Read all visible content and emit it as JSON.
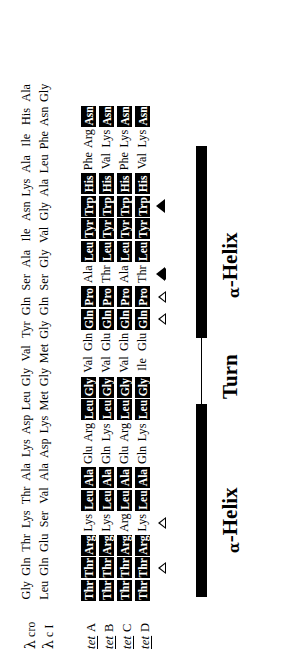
{
  "figure": {
    "sequence_rows": [
      {
        "id": "lambda-cro",
        "label_lambda": "λ",
        "label_name": "cro",
        "style": "plain",
        "residues": [
          "Gly",
          "Gln",
          "Thr",
          "Lys",
          "Thr",
          "Ala",
          "Lys",
          "Asp",
          "Leu",
          "Gly",
          "Val",
          "Tyr",
          "Gln",
          "Ser",
          "Ala",
          "Ile",
          "Asn",
          "Lys",
          "Ala",
          "Ile",
          "His",
          "Ala"
        ]
      },
      {
        "id": "lambda-ci",
        "label_lambda": "λ",
        "label_name": "c I",
        "style": "plain",
        "residues": [
          "Leu",
          "Gln",
          "Glu",
          "Ser",
          "Val",
          "Ala",
          "Asp",
          "Lys",
          "Met",
          "Gly",
          "Met",
          "Gly",
          "Gln",
          "Ser",
          "Gly",
          "Val",
          "Gly",
          "Ala",
          "Leu",
          "Phe",
          "Asn",
          "Gly"
        ]
      },
      {
        "id": "tet-A",
        "label_italic": "tet",
        "label_chain": "A",
        "style": "tet",
        "residues": [
          {
            "t": "Thr",
            "b": true
          },
          {
            "t": "Thr",
            "b": true
          },
          {
            "t": "Arg",
            "b": true
          },
          {
            "t": "Lys",
            "b": false
          },
          {
            "t": "Leu",
            "b": true
          },
          {
            "t": "Ala",
            "b": true
          },
          {
            "t": "Glu",
            "b": false
          },
          {
            "t": "Arg",
            "b": false
          },
          {
            "t": "Leu",
            "b": true
          },
          {
            "t": "Gly",
            "b": true
          },
          {
            "t": "Val",
            "b": false
          },
          {
            "t": "Gln",
            "b": false
          },
          {
            "t": "Gln",
            "b": true
          },
          {
            "t": "Pro",
            "b": true
          },
          {
            "t": "Ala",
            "b": false
          },
          {
            "t": "Leu",
            "b": true
          },
          {
            "t": "Tyr",
            "b": true
          },
          {
            "t": "Trp",
            "b": true
          },
          {
            "t": "His",
            "b": true
          },
          {
            "t": "Phe",
            "b": false
          },
          {
            "t": "Arg",
            "b": false
          },
          {
            "t": "Asn",
            "b": true
          }
        ]
      },
      {
        "id": "tet-B",
        "label_italic": "tet",
        "label_chain": "B",
        "style": "tet",
        "residues": [
          {
            "t": "Thr",
            "b": true
          },
          {
            "t": "Thr",
            "b": true
          },
          {
            "t": "Arg",
            "b": true
          },
          {
            "t": "Lys",
            "b": false
          },
          {
            "t": "Leu",
            "b": true
          },
          {
            "t": "Ala",
            "b": true
          },
          {
            "t": "Gln",
            "b": false
          },
          {
            "t": "Lys",
            "b": false
          },
          {
            "t": "Leu",
            "b": true
          },
          {
            "t": "Gly",
            "b": true
          },
          {
            "t": "Val",
            "b": false
          },
          {
            "t": "Glu",
            "b": false
          },
          {
            "t": "Gln",
            "b": true
          },
          {
            "t": "Pro",
            "b": true
          },
          {
            "t": "Thr",
            "b": false
          },
          {
            "t": "Leu",
            "b": true
          },
          {
            "t": "Tyr",
            "b": true
          },
          {
            "t": "Trp",
            "b": true
          },
          {
            "t": "His",
            "b": true
          },
          {
            "t": "Val",
            "b": false
          },
          {
            "t": "Lys",
            "b": false
          },
          {
            "t": "Asn",
            "b": true
          }
        ]
      },
      {
        "id": "tet-C",
        "label_italic": "tet",
        "label_chain": "C",
        "style": "tet",
        "residues": [
          {
            "t": "Thr",
            "b": true
          },
          {
            "t": "Thr",
            "b": true
          },
          {
            "t": "Arg",
            "b": true
          },
          {
            "t": "Arg",
            "b": false
          },
          {
            "t": "Leu",
            "b": true
          },
          {
            "t": "Ala",
            "b": true
          },
          {
            "t": "Glu",
            "b": false
          },
          {
            "t": "Arg",
            "b": false
          },
          {
            "t": "Leu",
            "b": true
          },
          {
            "t": "Gly",
            "b": true
          },
          {
            "t": "Val",
            "b": false
          },
          {
            "t": "Gln",
            "b": false
          },
          {
            "t": "Gln",
            "b": true
          },
          {
            "t": "Pro",
            "b": true
          },
          {
            "t": "Ala",
            "b": false
          },
          {
            "t": "Leu",
            "b": true
          },
          {
            "t": "Tyr",
            "b": true
          },
          {
            "t": "Trp",
            "b": true
          },
          {
            "t": "His",
            "b": true
          },
          {
            "t": "Phe",
            "b": false
          },
          {
            "t": "Lys",
            "b": false
          },
          {
            "t": "Asn",
            "b": true
          }
        ]
      },
      {
        "id": "tet-D",
        "label_italic": "tet",
        "label_chain": "D",
        "style": "tet",
        "residues": [
          {
            "t": "Thr",
            "b": true
          },
          {
            "t": "Thr",
            "b": true
          },
          {
            "t": "Arg",
            "b": true
          },
          {
            "t": "Lys",
            "b": false
          },
          {
            "t": "Leu",
            "b": true
          },
          {
            "t": "Ala",
            "b": true
          },
          {
            "t": "Gln",
            "b": false
          },
          {
            "t": "Lys",
            "b": false
          },
          {
            "t": "Leu",
            "b": true
          },
          {
            "t": "Gly",
            "b": true
          },
          {
            "t": "Ile",
            "b": false
          },
          {
            "t": "Glu",
            "b": false
          },
          {
            "t": "Gln",
            "b": true
          },
          {
            "t": "Pro",
            "b": true
          },
          {
            "t": "Thr",
            "b": false
          },
          {
            "t": "Leu",
            "b": true
          },
          {
            "t": "Tyr",
            "b": true
          },
          {
            "t": "Trp",
            "b": true
          },
          {
            "t": "His",
            "b": true
          },
          {
            "t": "Val",
            "b": false
          },
          {
            "t": "Lys",
            "b": false
          },
          {
            "t": "Asn",
            "b": true
          }
        ]
      }
    ],
    "markers": [
      {
        "id": "m1",
        "kind": "open",
        "residue_index": 1
      },
      {
        "id": "m2",
        "kind": "open",
        "residue_index": 3
      },
      {
        "id": "m3",
        "kind": "open",
        "residue_index": 12
      },
      {
        "id": "m4",
        "kind": "open",
        "residue_index": 13
      },
      {
        "id": "m5",
        "kind": "open",
        "residue_index": 14
      },
      {
        "id": "m6",
        "kind": "filled",
        "residue_index": 14
      },
      {
        "id": "m7",
        "kind": "filled",
        "residue_index": 17
      }
    ],
    "secondary_structure": {
      "segments": [
        {
          "id": "helix-1",
          "kind": "helix",
          "label": "α-Helix",
          "alpha": "α",
          "rest": "-Helix"
        },
        {
          "id": "turn",
          "kind": "turn",
          "label": "Turn",
          "alpha": "",
          "rest": "Turn"
        },
        {
          "id": "helix-2",
          "kind": "helix",
          "label": "α-Helix",
          "alpha": "α",
          "rest": "-Helix"
        }
      ]
    }
  }
}
